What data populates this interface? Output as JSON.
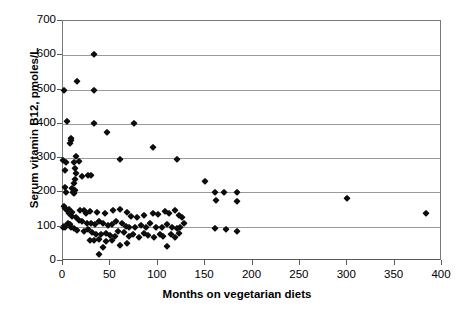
{
  "chart_data": {
    "type": "scatter",
    "title": "",
    "xlabel": "Months on vegetarian diets",
    "ylabel": "Serum vitamin B12, pmoles/L",
    "xlim": [
      0,
      400
    ],
    "ylim": [
      0,
      700
    ],
    "xticks": [
      0,
      50,
      100,
      150,
      200,
      250,
      300,
      350,
      400
    ],
    "yticks": [
      0,
      100,
      200,
      300,
      400,
      500,
      600,
      700
    ],
    "xtick_labels": [
      "0",
      "50",
      "100",
      "150",
      "200",
      "250",
      "300",
      "350",
      "400"
    ],
    "ytick_labels": [
      "0",
      "100",
      "200",
      "300",
      "400",
      "500",
      "600",
      "700"
    ],
    "grid": "horizontal",
    "legend": null,
    "marker": "diamond",
    "marker_color": "#0d0d0d",
    "points": [
      [
        33,
        603
      ],
      [
        1,
        500
      ],
      [
        33,
        498
      ],
      [
        15,
        525
      ],
      [
        4,
        408
      ],
      [
        33,
        402
      ],
      [
        75,
        402
      ],
      [
        46,
        375
      ],
      [
        8,
        360
      ],
      [
        8,
        352
      ],
      [
        7,
        345
      ],
      [
        95,
        332
      ],
      [
        0,
        295
      ],
      [
        14,
        305
      ],
      [
        60,
        297
      ],
      [
        120,
        297
      ],
      [
        3,
        290
      ],
      [
        12,
        288
      ],
      [
        17,
        292
      ],
      [
        2,
        265
      ],
      [
        13,
        272
      ],
      [
        14,
        258
      ],
      [
        26,
        252
      ],
      [
        30,
        250
      ],
      [
        13,
        240
      ],
      [
        20,
        247
      ],
      [
        12,
        228
      ],
      [
        150,
        232
      ],
      [
        2,
        215
      ],
      [
        10,
        212
      ],
      [
        13,
        207
      ],
      [
        11,
        200
      ],
      [
        3,
        200
      ],
      [
        160,
        200
      ],
      [
        170,
        200
      ],
      [
        184,
        200
      ],
      [
        12,
        198
      ],
      [
        1,
        160
      ],
      [
        2,
        155
      ],
      [
        6,
        152
      ],
      [
        162,
        178
      ],
      [
        184,
        175
      ],
      [
        18,
        148
      ],
      [
        22,
        150
      ],
      [
        28,
        145
      ],
      [
        24,
        140
      ],
      [
        36,
        143
      ],
      [
        44,
        140
      ],
      [
        53,
        148
      ],
      [
        0,
        100
      ],
      [
        1,
        103
      ],
      [
        2,
        100
      ],
      [
        60,
        152
      ],
      [
        68,
        142
      ],
      [
        72,
        130
      ],
      [
        78,
        128
      ],
      [
        85,
        135
      ],
      [
        95,
        140
      ],
      [
        100,
        138
      ],
      [
        108,
        145
      ],
      [
        112,
        140
      ],
      [
        118,
        150
      ],
      [
        122,
        135
      ],
      [
        126,
        128
      ],
      [
        10,
        132
      ],
      [
        14,
        128
      ],
      [
        17,
        120
      ],
      [
        20,
        118
      ],
      [
        25,
        112
      ],
      [
        30,
        110
      ],
      [
        34,
        108
      ],
      [
        38,
        118
      ],
      [
        42,
        112
      ],
      [
        47,
        105
      ],
      [
        52,
        108
      ],
      [
        56,
        118
      ],
      [
        62,
        110
      ],
      [
        66,
        103
      ],
      [
        70,
        100
      ],
      [
        76,
        98
      ],
      [
        82,
        105
      ],
      [
        88,
        100
      ],
      [
        92,
        112
      ],
      [
        98,
        100
      ],
      [
        104,
        98
      ],
      [
        110,
        108
      ],
      [
        115,
        100
      ],
      [
        120,
        95
      ],
      [
        124,
        100
      ],
      [
        128,
        110
      ],
      [
        8,
        98
      ],
      [
        12,
        95
      ],
      [
        15,
        90
      ],
      [
        22,
        88
      ],
      [
        26,
        92
      ],
      [
        31,
        85
      ],
      [
        35,
        78
      ],
      [
        40,
        80
      ],
      [
        45,
        82
      ],
      [
        50,
        75
      ],
      [
        55,
        72
      ],
      [
        58,
        88
      ],
      [
        64,
        85
      ],
      [
        70,
        72
      ],
      [
        74,
        78
      ],
      [
        80,
        70
      ],
      [
        86,
        82
      ],
      [
        90,
        75
      ],
      [
        96,
        70
      ],
      [
        102,
        80
      ],
      [
        106,
        72
      ],
      [
        114,
        78
      ],
      [
        118,
        70
      ],
      [
        122,
        82
      ],
      [
        4,
        148
      ],
      [
        6,
        140
      ],
      [
        9,
        142
      ],
      [
        5,
        112
      ],
      [
        7,
        108
      ],
      [
        28,
        62
      ],
      [
        33,
        60
      ],
      [
        38,
        65
      ],
      [
        45,
        58
      ],
      [
        52,
        60
      ],
      [
        60,
        48
      ],
      [
        68,
        52
      ],
      [
        42,
        42
      ],
      [
        110,
        45
      ],
      [
        38,
        20
      ],
      [
        160,
        95
      ],
      [
        172,
        92
      ],
      [
        184,
        88
      ],
      [
        300,
        185
      ],
      [
        383,
        140
      ]
    ]
  }
}
